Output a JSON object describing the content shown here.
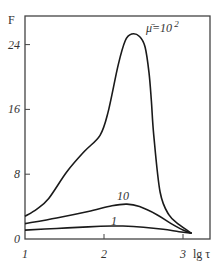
{
  "chart_data": {
    "type": "line",
    "title": "",
    "xlabel": "lg τ",
    "ylabel": "F",
    "xlim": [
      1,
      3.3
    ],
    "ylim": [
      0,
      27.5
    ],
    "xticks": [
      1,
      2,
      3
    ],
    "xtick_labels": [
      "1",
      "2",
      "3"
    ],
    "yticks": [
      0,
      8,
      16,
      24
    ],
    "ytick_labels": [
      "0",
      "8",
      "16",
      "24"
    ],
    "grid": false,
    "legend": "inline curve labels",
    "series": [
      {
        "name": "μ̄=10²",
        "label": "μ̄=10",
        "label_sup": "2",
        "x": [
          1.0,
          1.15,
          1.3,
          1.53,
          1.75,
          1.95,
          2.05,
          2.18,
          2.27,
          2.35,
          2.45,
          2.52,
          2.57,
          2.6,
          2.63,
          2.71,
          2.82,
          2.96,
          3.11
        ],
        "y": [
          2.8,
          3.7,
          5.0,
          8.3,
          10.8,
          12.8,
          15.6,
          21.5,
          24.5,
          25.3,
          25.0,
          23.7,
          20.5,
          17.0,
          12.8,
          5.8,
          3.0,
          1.7,
          0.7
        ]
      },
      {
        "name": "10",
        "label": "10",
        "x": [
          1.0,
          1.4,
          1.8,
          2.1,
          2.29,
          2.45,
          2.67,
          2.85,
          3.0,
          3.11
        ],
        "y": [
          1.9,
          2.6,
          3.4,
          4.1,
          4.3,
          4.0,
          3.0,
          1.9,
          1.1,
          0.7
        ]
      },
      {
        "name": "1",
        "label": "1",
        "x": [
          1.0,
          1.4,
          1.8,
          2.1,
          2.24,
          2.5,
          2.75,
          2.95,
          3.11
        ],
        "y": [
          1.1,
          1.3,
          1.5,
          1.6,
          1.6,
          1.45,
          1.2,
          0.9,
          0.7
        ]
      }
    ]
  }
}
